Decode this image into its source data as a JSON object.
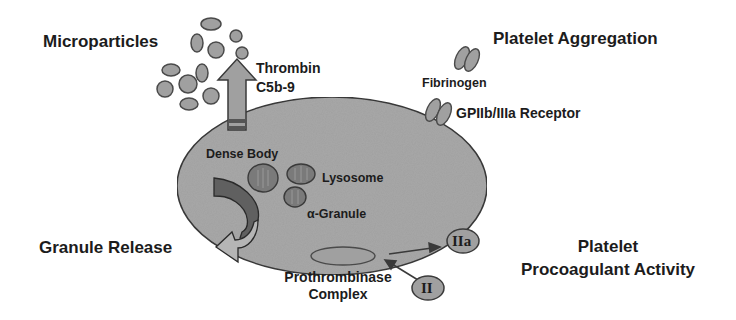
{
  "diagram": {
    "colors": {
      "platelet_fill": "#a8a8a8",
      "platelet_stroke": "#3a3a3a",
      "particle_fill": "#a0a0a0",
      "organelle_fill": "#7a7a7a",
      "dark_band": "#555555",
      "text": "#1c1c1c"
    },
    "labels": {
      "microparticles": "Microparticles",
      "thrombin": "Thrombin",
      "c5b9": "C5b-9",
      "platelet_aggregation": "Platelet Aggregation",
      "fibrinogen": "Fibrinogen",
      "gpiib_iiia": "GPIIb/IIIa Receptor",
      "dense_body": "Dense Body",
      "lysosome": "Lysosome",
      "alpha_granule": "α-Granule",
      "granule_release": "Granule Release",
      "prothrombinase_line1": "Prothrombinase",
      "prothrombinase_line2": "Complex",
      "iia": "IIa",
      "ii": "II",
      "procoag_line1": "Platelet",
      "procoag_line2": "Procoagulant Activity"
    }
  }
}
